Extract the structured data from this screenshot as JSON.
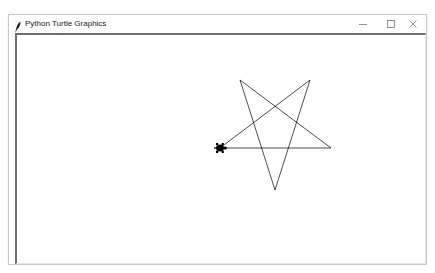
{
  "window": {
    "title": "Python Turtle Graphics",
    "icon": "feather-icon",
    "controls": {
      "minimize": "minimize-icon",
      "maximize": "maximize-icon",
      "close": "close-icon"
    }
  },
  "canvas": {
    "background": "#ffffff",
    "pen_color": "#000000",
    "shape": "pentagram",
    "vertices": [
      {
        "x": 220,
        "y": 148
      },
      {
        "x": 331,
        "y": 148
      },
      {
        "x": 240,
        "y": 80
      },
      {
        "x": 275,
        "y": 190
      },
      {
        "x": 310,
        "y": 80
      }
    ],
    "turtle": {
      "x": 220,
      "y": 148,
      "heading": "east",
      "shape": "turtle",
      "color": "#000000"
    }
  }
}
